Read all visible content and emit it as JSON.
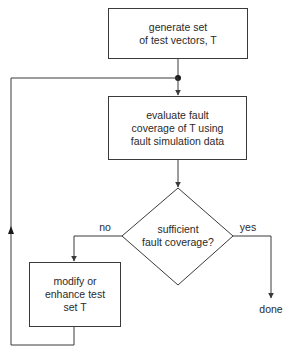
{
  "diagram": {
    "type": "flowchart",
    "colors": {
      "stroke": "#3a3a3a",
      "text": "#2a2a2a",
      "background": "#ffffff"
    },
    "nodes": {
      "generate": {
        "shape": "rectangle",
        "lines": [
          "generate set",
          "of test vectors, T"
        ]
      },
      "evaluate": {
        "shape": "rectangle",
        "lines": [
          "evaluate fault",
          "coverage of T using",
          "fault simulation data"
        ]
      },
      "decision": {
        "shape": "diamond",
        "lines": [
          "sufficient",
          "fault coverage?"
        ]
      },
      "modify": {
        "shape": "rectangle",
        "lines": [
          "modify or",
          "enhance test",
          "set T"
        ]
      },
      "done": {
        "shape": "terminal-label",
        "label": "done"
      }
    },
    "edges": {
      "yes_label": "yes",
      "no_label": "no"
    },
    "connections": [
      {
        "from": "generate",
        "to": "evaluate"
      },
      {
        "from": "evaluate",
        "to": "decision"
      },
      {
        "from": "decision",
        "to": "done",
        "label": "yes"
      },
      {
        "from": "decision",
        "to": "modify",
        "label": "no"
      },
      {
        "from": "modify",
        "to": "evaluate",
        "note": "loop back via junction"
      }
    ]
  }
}
